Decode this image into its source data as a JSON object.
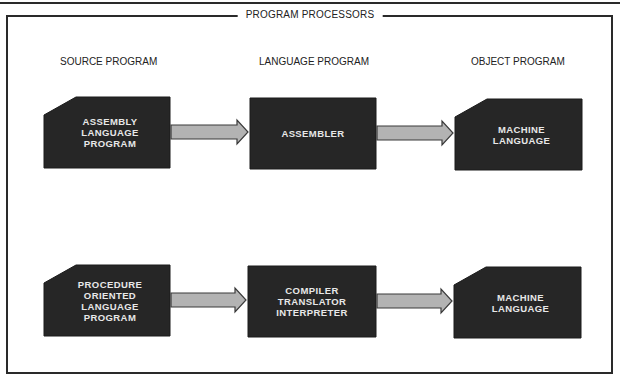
{
  "title": "PROGRAM PROCESSORS",
  "columns": [
    {
      "header": "SOURCE PROGRAM"
    },
    {
      "header": "LANGUAGE PROGRAM"
    },
    {
      "header": "OBJECT PROGRAM"
    }
  ],
  "rows": [
    {
      "source": {
        "lines": [
          "ASSEMBLY",
          "LANGUAGE",
          "PROGRAM"
        ]
      },
      "processor": {
        "lines": [
          "ASSEMBLER"
        ]
      },
      "object": {
        "lines": [
          "MACHINE",
          "LANGUAGE"
        ]
      }
    },
    {
      "source": {
        "lines": [
          "PROCEDURE",
          "ORIENTED",
          "LANGUAGE",
          "PROGRAM"
        ]
      },
      "processor": {
        "lines": [
          "COMPILER",
          "TRANSLATOR",
          "INTERPRETER"
        ]
      },
      "object": {
        "lines": [
          "MACHINE",
          "LANGUAGE"
        ]
      }
    }
  ],
  "colors": {
    "block_fill": "#262626",
    "block_text": "#e8e8e8",
    "arrow_fill": "#b3b3b3",
    "arrow_stroke": "#3a3a3a",
    "frame": "#2a2a2a"
  }
}
